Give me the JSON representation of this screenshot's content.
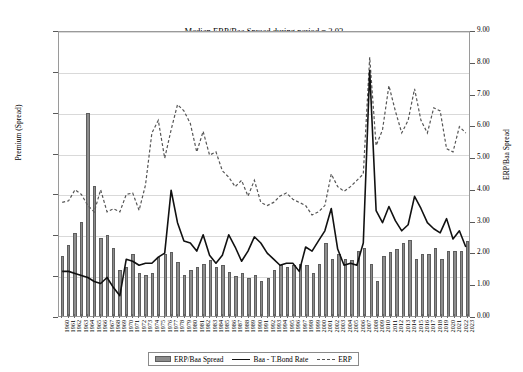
{
  "chart_data": {
    "type": "bar",
    "title": "Median ERP/Baa Spread during period = 2.03",
    "xlabel": "",
    "ylabel": "Premium (Spread)",
    "ylabel_right": "ERP/Baa Spread",
    "ylim": [
      0,
      0.07
    ],
    "ylim_right": [
      0,
      9
    ],
    "grid": true,
    "legend_position": "bottom",
    "yticks_left": [
      "0.00%",
      "1.00%",
      "2.00%",
      "3.00%",
      "4.00%",
      "5.00%",
      "6.00%",
      "7.00%"
    ],
    "yticks_right": [
      "0.00",
      "1.00",
      "2.00",
      "3.00",
      "4.00",
      "5.00",
      "6.00",
      "7.00",
      "8.00",
      "9.00"
    ],
    "categories": [
      "1960",
      "1961",
      "1962",
      "1963",
      "1964",
      "1965",
      "1966",
      "1967",
      "1968",
      "1969",
      "1970",
      "1971",
      "1972",
      "1973",
      "1974",
      "1975",
      "1976",
      "1977",
      "1978",
      "1979",
      "1980",
      "1981",
      "1982",
      "1983",
      "1984",
      "1985",
      "1986",
      "1987",
      "1988",
      "1989",
      "1990",
      "1991",
      "1992",
      "1993",
      "1994",
      "1995",
      "1996",
      "1997",
      "1998",
      "1999",
      "2000",
      "2001",
      "2002",
      "2003",
      "2004",
      "2005",
      "2006",
      "2007",
      "2008",
      "2009",
      "2010",
      "2011",
      "2012",
      "2013",
      "2014",
      "2015",
      "2016",
      "2017",
      "2018",
      "2019",
      "2020",
      "2021",
      "2022",
      "2023"
    ],
    "series": [
      {
        "name": "ERP/Baa Spread",
        "axis": "right",
        "type": "bar",
        "values": [
          1.9,
          2.25,
          2.6,
          2.95,
          6.4,
          4.1,
          2.45,
          2.55,
          2.15,
          1.45,
          1.55,
          1.95,
          1.35,
          1.3,
          1.35,
          1.85,
          1.95,
          2.0,
          1.7,
          1.3,
          1.45,
          1.55,
          1.65,
          1.75,
          1.55,
          1.6,
          1.4,
          1.25,
          1.35,
          1.2,
          1.3,
          1.1,
          1.2,
          1.45,
          1.6,
          1.55,
          1.6,
          1.65,
          1.6,
          1.35,
          1.65,
          2.3,
          1.8,
          1.95,
          1.8,
          1.75,
          2.05,
          2.15,
          1.65,
          1.1,
          1.9,
          2.0,
          2.1,
          2.3,
          2.4,
          1.8,
          1.95,
          1.95,
          2.15,
          1.8,
          2.05,
          2.05,
          2.05,
          2.35
        ]
      },
      {
        "name": "Baa - T.Bond Rate",
        "axis": "left",
        "type": "line",
        "values": [
          1.1,
          1.1,
          1.05,
          1.0,
          0.95,
          0.85,
          0.8,
          0.95,
          0.7,
          0.5,
          1.4,
          1.35,
          1.25,
          1.3,
          1.3,
          1.45,
          1.55,
          3.1,
          2.3,
          1.85,
          1.8,
          1.6,
          2.0,
          1.5,
          1.3,
          1.5,
          2.0,
          1.7,
          1.35,
          1.6,
          1.95,
          1.8,
          1.55,
          1.4,
          1.25,
          1.3,
          1.3,
          1.1,
          1.7,
          1.6,
          1.85,
          2.1,
          2.65,
          1.65,
          1.25,
          1.3,
          1.25,
          1.8,
          6.05,
          2.6,
          2.3,
          2.7,
          2.35,
          2.1,
          2.25,
          2.95,
          2.65,
          2.3,
          2.15,
          2.05,
          2.4,
          1.9,
          2.1,
          1.7
        ]
      },
      {
        "name": "ERP",
        "axis": "right",
        "type": "line-dashed",
        "values": [
          3.6,
          3.65,
          4.0,
          3.85,
          3.5,
          3.3,
          4.0,
          3.3,
          3.4,
          3.3,
          3.85,
          3.9,
          3.35,
          4.15,
          5.8,
          6.2,
          5.0,
          5.9,
          6.7,
          6.5,
          6.1,
          5.2,
          5.85,
          5.1,
          5.2,
          4.6,
          4.4,
          4.1,
          4.3,
          3.8,
          4.3,
          3.6,
          3.5,
          3.6,
          3.8,
          3.9,
          3.7,
          3.6,
          3.5,
          3.2,
          3.3,
          3.5,
          4.5,
          4.1,
          3.95,
          4.1,
          4.3,
          4.5,
          8.2,
          5.4,
          5.9,
          7.3,
          6.5,
          5.8,
          6.2,
          7.2,
          6.2,
          5.8,
          6.6,
          6.5,
          5.3,
          5.2,
          6.0,
          5.8
        ]
      }
    ]
  },
  "legend": {
    "entries": [
      {
        "label": "ERP/Baa Spread",
        "marker": "bar-swatch"
      },
      {
        "label": "Baa - T.Bond Rate",
        "marker": "solid-line-swatch"
      },
      {
        "label": "ERP",
        "marker": "dashed-line-swatch"
      }
    ]
  },
  "colors": {
    "bar_fill": "#8c8c8c",
    "bar_edge": "#5e5e5e",
    "line_solid": "#111111",
    "line_dashed": "#555555",
    "grid": "#d9d9d9",
    "frame": "#9a9a9a",
    "background": "#ffffff"
  }
}
